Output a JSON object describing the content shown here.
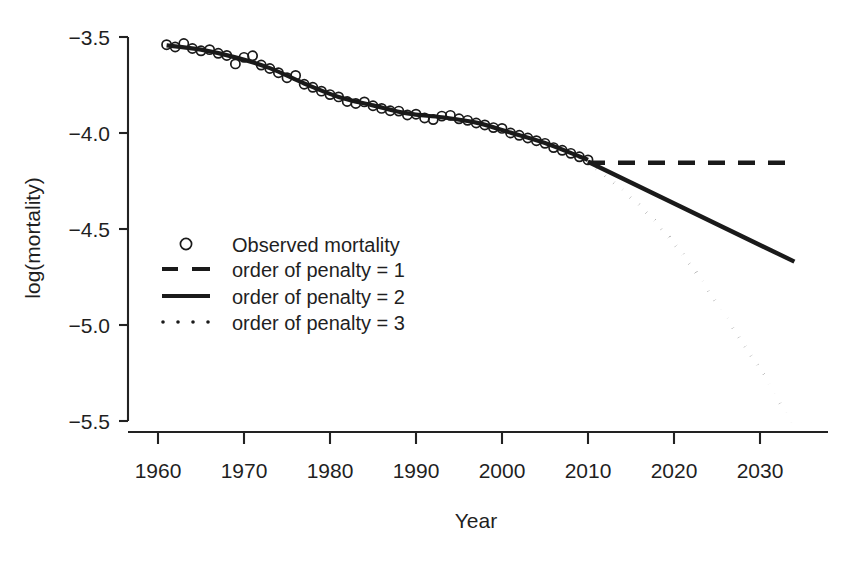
{
  "chart_data": {
    "type": "line",
    "title": "",
    "xlabel": "Year",
    "ylabel": "log(mortality)",
    "xlim": [
      1958,
      2036
    ],
    "ylim": [
      -5.62,
      -3.42
    ],
    "grid": false,
    "legend_position": "center-left",
    "x_ticks": [
      1960,
      1970,
      1980,
      1990,
      2000,
      2010,
      2020,
      2030
    ],
    "x_tick_labels": [
      "1960",
      "1970",
      "1980",
      "1990",
      "2000",
      "2010",
      "2020",
      "2030"
    ],
    "y_ticks": [
      -3.5,
      -4.0,
      -4.5,
      -5.0,
      -5.5
    ],
    "y_tick_labels": [
      "−3.5",
      "−4.0",
      "−4.5",
      "−5.0",
      "−5.5"
    ],
    "legend": [
      {
        "label": "Observed mortality",
        "marker": "circle",
        "style": "points"
      },
      {
        "label": "order of penalty = 1",
        "marker": "dashed",
        "style": "dashed"
      },
      {
        "label": "order of penalty = 2",
        "marker": "solid",
        "style": "solid"
      },
      {
        "label": "order of penalty = 3",
        "marker": "dotted",
        "style": "dotted"
      }
    ],
    "series": [
      {
        "name": "Observed mortality",
        "style": "points",
        "x": [
          1961,
          1962,
          1963,
          1964,
          1965,
          1966,
          1967,
          1968,
          1969,
          1970,
          1971,
          1972,
          1973,
          1974,
          1975,
          1976,
          1977,
          1978,
          1979,
          1980,
          1981,
          1982,
          1983,
          1984,
          1985,
          1986,
          1987,
          1988,
          1989,
          1990,
          1991,
          1992,
          1993,
          1994,
          1995,
          1996,
          1997,
          1998,
          1999,
          2000,
          2001,
          2002,
          2003,
          2004,
          2005,
          2006,
          2007,
          2008,
          2009,
          2010
        ],
        "y": [
          -3.54,
          -3.552,
          -3.534,
          -3.56,
          -3.572,
          -3.566,
          -3.585,
          -3.596,
          -3.64,
          -3.606,
          -3.598,
          -3.646,
          -3.664,
          -3.686,
          -3.712,
          -3.7,
          -3.746,
          -3.762,
          -3.782,
          -3.8,
          -3.812,
          -3.836,
          -3.846,
          -3.838,
          -3.858,
          -3.872,
          -3.884,
          -3.886,
          -3.906,
          -3.902,
          -3.922,
          -3.93,
          -3.912,
          -3.908,
          -3.926,
          -3.934,
          -3.948,
          -3.958,
          -3.972,
          -3.976,
          -4.0,
          -4.012,
          -4.026,
          -4.04,
          -4.054,
          -4.076,
          -4.09,
          -4.106,
          -4.124,
          -4.14
        ],
        "marker": "open-circle"
      },
      {
        "name": "fitted",
        "style": "solid",
        "x": [
          1961,
          1965,
          1969,
          1973,
          1977,
          1981,
          1985,
          1989,
          1993,
          1997,
          2001,
          2005,
          2009,
          2010
        ],
        "y": [
          -3.544,
          -3.566,
          -3.606,
          -3.662,
          -3.742,
          -3.812,
          -3.856,
          -3.898,
          -3.918,
          -3.946,
          -3.998,
          -4.052,
          -4.122,
          -4.14
        ]
      },
      {
        "name": "order of penalty = 1",
        "style": "dashed",
        "x": [
          2010,
          2034
        ],
        "y": [
          -4.155,
          -4.155
        ]
      },
      {
        "name": "order of penalty = 2",
        "style": "solid",
        "x": [
          2010,
          2034
        ],
        "y": [
          -4.15,
          -4.67
        ]
      },
      {
        "name": "order of penalty = 3",
        "style": "dotted",
        "x": [
          2010,
          2014,
          2018,
          2022,
          2026,
          2030,
          2034
        ],
        "y": [
          -4.15,
          -4.295,
          -4.47,
          -4.69,
          -4.955,
          -5.23,
          -5.53
        ]
      }
    ]
  }
}
